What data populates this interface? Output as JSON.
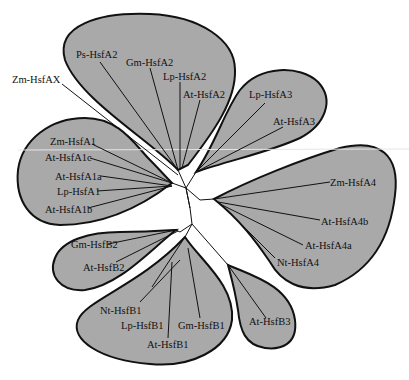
{
  "figure": {
    "type": "unrooted phylogenetic tree",
    "colors": {
      "clade_fill": "#a9a9a9",
      "outline": "#111111",
      "background": "#ffffff"
    }
  },
  "clades": [
    {
      "name": "HsfA2",
      "leaves": [
        "Ps-HsfA2",
        "Gm-HsfA2",
        "Lp-HsfA2",
        "At-HsfA2"
      ]
    },
    {
      "name": "HsfA3",
      "leaves": [
        "Lp-HsfA3",
        "At-HsfA3"
      ]
    },
    {
      "name": "HsfA4",
      "leaves": [
        "Zm-HsfA4",
        "At-HsfA4b",
        "At-HsfA4a",
        "Nt-HsfA4"
      ]
    },
    {
      "name": "HsfB3",
      "leaves": [
        "At-HsfB3"
      ]
    },
    {
      "name": "HsfB1",
      "leaves": [
        "Nt-HsfB1",
        "Lp-HsfB1",
        "At-HsfB1",
        "Gm-HsfB1"
      ]
    },
    {
      "name": "HsfB2",
      "leaves": [
        "Gm-HsfB2",
        "At-HsfB2"
      ]
    },
    {
      "name": "HsfA1",
      "leaves": [
        "Zm-HsfA1",
        "At-HsfA1c",
        "At-HsfA1a",
        "Lp-HsfA1",
        "At-HsfA1b"
      ]
    }
  ],
  "unclustered": [
    "Zm-HsfAX"
  ],
  "labels": {
    "ps_hsfa2": "Ps-HsfA2",
    "gm_hsfa2": "Gm-HsfA2",
    "lp_hsfa2": "Lp-HsfA2",
    "at_hsfa2": "At-HsfA2",
    "zm_hsfax": "Zm-HsfAX",
    "lp_hsfa3": "Lp-HsfA3",
    "at_hsfa3": "At-HsfA3",
    "zm_hsfa1": "Zm-HsfA1",
    "at_hsfa1c": "At-HsfA1c",
    "at_hsfa1a": "At-HsfA1a",
    "lp_hsfa1": "Lp-HsfA1",
    "at_hsfa1b": "At-HsfA1b",
    "zm_hsfa4": "Zm-HsfA4",
    "at_hsfa4b": "At-HsfA4b",
    "at_hsfa4a": "At-HsfA4a",
    "nt_hsfa4": "Nt-HsfA4",
    "gm_hsfb2": "Gm-HsfB2",
    "at_hsfb2": "At-HsfB2",
    "nt_hsfb1": "Nt-HsfB1",
    "lp_hsfb1": "Lp-HsfB1",
    "gm_hsfb1": "Gm-HsfB1",
    "at_hsfb1": "At-HsfB1",
    "at_hsfb3": "At-HsfB3"
  }
}
